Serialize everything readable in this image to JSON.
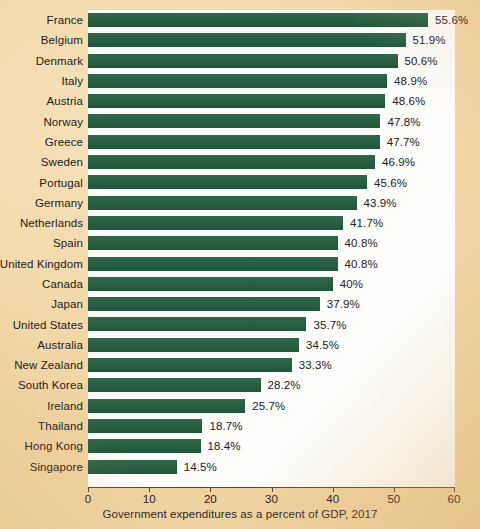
{
  "chart_data": {
    "type": "bar",
    "orientation": "horizontal",
    "title": "",
    "caption": "Government expenditures as a percent of GDP, 2017",
    "xlabel": "Government expenditures as a percent of GDP, 2017",
    "ylabel": "",
    "xlim": [
      0,
      60
    ],
    "xticks": [
      0,
      10,
      20,
      30,
      40,
      50,
      60
    ],
    "xtick_labels": [
      "0",
      "10",
      "20",
      "30",
      "40",
      "50",
      "60"
    ],
    "grid": false,
    "legend": null,
    "bar_color": "#215c3e",
    "plot_background": "#fdfdfb",
    "page_background": "#f2dbab",
    "categories": [
      "France",
      "Belgium",
      "Denmark",
      "Italy",
      "Austria",
      "Norway",
      "Greece",
      "Sweden",
      "Portugal",
      "Germany",
      "Netherlands",
      "Spain",
      "United Kingdom",
      "Canada",
      "Japan",
      "United States",
      "Australia",
      "New Zealand",
      "South Korea",
      "Ireland",
      "Thailand",
      "Hong Kong",
      "Singapore"
    ],
    "values": [
      55.6,
      51.9,
      50.6,
      48.9,
      48.6,
      47.8,
      47.7,
      46.9,
      45.6,
      43.9,
      41.7,
      40.8,
      40.8,
      40,
      37.9,
      35.7,
      34.5,
      33.3,
      28.2,
      25.7,
      18.7,
      18.4,
      14.5
    ],
    "value_labels": [
      "55.6%",
      "51.9%",
      "50.6%",
      "48.9%",
      "48.6%",
      "47.8%",
      "47.7%",
      "46.9%",
      "45.6%",
      "43.9%",
      "41.7%",
      "40.8%",
      "40.8%",
      "40%",
      "37.9%",
      "35.7%",
      "34.5%",
      "33.3%",
      "28.2%",
      "25.7%",
      "18.7%",
      "18.4%",
      "14.5%"
    ]
  }
}
